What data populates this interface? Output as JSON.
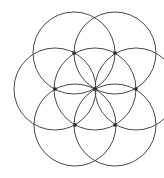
{
  "figure": {
    "name": "seed-of-life-overlapping-circles",
    "title": "Seven overlapping circles geometric figure",
    "background_color": "#ffffff",
    "stroke_color": "#4a4a4a",
    "stroke_color_dark": "#333333",
    "node_color": "#2b2b2b",
    "stroke_width": 1,
    "canvas": {
      "width": 164,
      "height": 178
    },
    "radius": 41,
    "circles": [
      {
        "label": "center-circle",
        "cx": 95,
        "cy": 89,
        "r": 41
      },
      {
        "label": "upper-left-circle",
        "cx": 74,
        "cy": 53,
        "r": 41
      },
      {
        "label": "upper-right-circle",
        "cx": 115,
        "cy": 53,
        "r": 41
      },
      {
        "label": "left-circle",
        "cx": 55,
        "cy": 89,
        "r": 41
      },
      {
        "label": "right-circle",
        "cx": 136,
        "cy": 89,
        "r": 41
      },
      {
        "label": "lower-left-circle",
        "cx": 75,
        "cy": 125,
        "r": 41
      },
      {
        "label": "lower-right-circle",
        "cx": 115,
        "cy": 125,
        "r": 41
      }
    ],
    "nodes": [
      {
        "label": "center-node",
        "x": 95,
        "y": 89
      },
      {
        "label": "top-node",
        "x": 74,
        "y": 53
      },
      {
        "label": "top-right-node",
        "x": 115,
        "y": 53
      },
      {
        "label": "left-node",
        "x": 55,
        "y": 89
      },
      {
        "label": "right-node",
        "x": 136,
        "y": 89
      },
      {
        "label": "bottom-left-node",
        "x": 75,
        "y": 125
      },
      {
        "label": "bottom-node",
        "x": 115,
        "y": 125
      }
    ]
  }
}
